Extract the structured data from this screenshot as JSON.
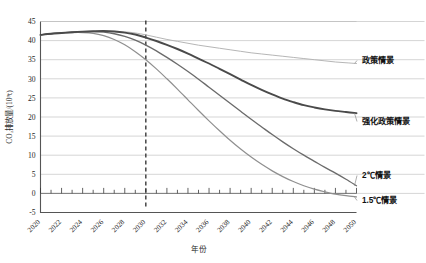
{
  "chart_data": {
    "type": "line",
    "title": "",
    "xlabel": "年份",
    "ylabel": "CO₂排放量/(10⁹t)",
    "xlim": [
      2020,
      2050
    ],
    "ylim": [
      -5,
      45
    ],
    "grid": true,
    "legend_position": "right-inline-labels",
    "xticks": [
      "2020",
      "2022",
      "2024",
      "2026",
      "2028",
      "2030",
      "2032",
      "2034",
      "2036",
      "2038",
      "2040",
      "2042",
      "2044",
      "2046",
      "2048",
      "2050"
    ],
    "xtick_minor_step": 1,
    "yticks": [
      "-5",
      "0",
      "5",
      "10",
      "15",
      "20",
      "25",
      "30",
      "35",
      "40",
      "45"
    ],
    "annotations": [
      {
        "name": "reference-year-marker",
        "type": "vertical-dashed-line",
        "x": 2030,
        "label": ""
      }
    ],
    "x": [
      2020,
      2021,
      2022,
      2023,
      2024,
      2025,
      2026,
      2027,
      2028,
      2029,
      2030,
      2031,
      2032,
      2033,
      2034,
      2035,
      2036,
      2037,
      2038,
      2039,
      2040,
      2041,
      2042,
      2043,
      2044,
      2045,
      2046,
      2047,
      2048,
      2049,
      2050
    ],
    "series": [
      {
        "name": "政策情景",
        "label": "政策情景",
        "color": "#b6b6b6",
        "values": [
          41.5,
          41.8,
          42.0,
          42.2,
          42.35,
          42.45,
          42.5,
          42.45,
          42.3,
          42.0,
          41.5,
          40.9,
          40.3,
          39.8,
          39.3,
          38.8,
          38.4,
          38.0,
          37.6,
          37.2,
          36.8,
          36.5,
          36.2,
          35.9,
          35.6,
          35.3,
          35.0,
          34.7,
          34.4,
          34.2,
          34.0
        ]
      },
      {
        "name": "强化政策情景",
        "label": "强化政策情景",
        "color": "#4a4a4a",
        "values": [
          41.5,
          41.8,
          42.0,
          42.2,
          42.35,
          42.45,
          42.5,
          42.4,
          42.1,
          41.6,
          40.8,
          39.9,
          38.9,
          37.8,
          36.6,
          35.3,
          34.0,
          32.6,
          31.2,
          29.8,
          28.4,
          27.1,
          25.9,
          24.8,
          23.9,
          23.1,
          22.5,
          22.0,
          21.6,
          21.3,
          21.0
        ]
      },
      {
        "name": "2℃情景",
        "label": "2℃情景",
        "color": "#6b6b6b",
        "values": [
          41.5,
          41.8,
          42.0,
          42.2,
          42.3,
          42.35,
          42.2,
          41.8,
          41.1,
          40.1,
          38.8,
          37.3,
          35.6,
          33.8,
          31.9,
          29.9,
          27.8,
          25.7,
          23.6,
          21.5,
          19.4,
          17.4,
          15.4,
          13.5,
          11.7,
          10.0,
          8.4,
          6.8,
          5.3,
          3.7,
          2.0
        ]
      },
      {
        "name": "1.5℃情景",
        "label": "1.5℃情景",
        "color": "#8f8f8f",
        "values": [
          41.5,
          41.8,
          42.0,
          42.1,
          42.1,
          41.9,
          41.3,
          40.3,
          38.9,
          37.1,
          35.0,
          32.6,
          30.0,
          27.3,
          24.5,
          21.7,
          19.0,
          16.4,
          13.9,
          11.6,
          9.5,
          7.6,
          5.9,
          4.4,
          3.1,
          2.0,
          1.1,
          0.4,
          -0.2,
          -0.6,
          -0.9
        ]
      }
    ]
  },
  "labels": {
    "policy": "政策情景",
    "enhanced_policy": "强化政策情景",
    "two_degree": "2℃情景",
    "one_five_degree": "1.5℃情景"
  }
}
